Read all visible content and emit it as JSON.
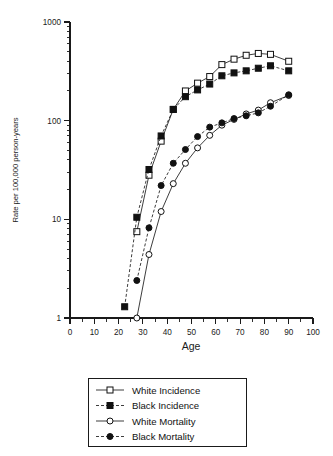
{
  "chart_data": {
    "type": "line",
    "title": "",
    "xlabel": "Age",
    "ylabel": "Rate per 100,000 person-years",
    "xlim": [
      0,
      100
    ],
    "ylim": [
      1,
      1000
    ],
    "yscale": "log",
    "xscale": "linear",
    "grid": false,
    "legend_position": "below-plot",
    "x_ticks": [
      0,
      10,
      20,
      30,
      40,
      50,
      60,
      70,
      80,
      90,
      100
    ],
    "x_tick_labels": [
      "0",
      "10",
      "20",
      "30",
      "40",
      "50",
      "60",
      "70",
      "80",
      "90",
      "100"
    ],
    "y_ticks": [
      1,
      10,
      100,
      1000
    ],
    "y_tick_labels": [
      "1",
      "10",
      "100",
      "1000"
    ],
    "x": [
      22.5,
      27.5,
      32.5,
      37.5,
      42.5,
      47.5,
      52.5,
      57.5,
      62.5,
      67.5,
      72.5,
      77.5,
      82.5,
      90
    ],
    "series": [
      {
        "name": "White Incidence",
        "marker": "open-square",
        "linestyle": "solid",
        "values": [
          null,
          7.5,
          28,
          62,
          130,
          200,
          240,
          280,
          370,
          420,
          460,
          480,
          470,
          400
        ]
      },
      {
        "name": "Black Incidence",
        "marker": "filled-square",
        "linestyle": "dashed",
        "values": [
          1.3,
          10.5,
          32,
          70,
          130,
          175,
          205,
          235,
          285,
          305,
          320,
          340,
          360,
          320
        ]
      },
      {
        "name": "White Mortality",
        "marker": "open-circle",
        "linestyle": "solid",
        "values": [
          null,
          1.0,
          4.4,
          12,
          23,
          37,
          53,
          71,
          90,
          103,
          117,
          128,
          152,
          180
        ]
      },
      {
        "name": "Black Mortality",
        "marker": "filled-circle",
        "linestyle": "dashed",
        "values": [
          null,
          2.4,
          8.2,
          22,
          37,
          51,
          69,
          86,
          95,
          105,
          112,
          120,
          140,
          183
        ]
      }
    ]
  },
  "legend": {
    "entries": [
      {
        "label": "White Incidence",
        "marker": "open-square",
        "linestyle": "solid"
      },
      {
        "label": "Black Incidence",
        "marker": "filled-square",
        "linestyle": "dashed"
      },
      {
        "label": "White Mortality",
        "marker": "open-circle",
        "linestyle": "solid"
      },
      {
        "label": "Black Mortality",
        "marker": "filled-circle",
        "linestyle": "dashed"
      }
    ]
  },
  "colors": {
    "ink": "#1a1a1a",
    "background": "#ffffff",
    "marker_fill_open": "#ffffff",
    "marker_fill_closed": "#111111"
  }
}
